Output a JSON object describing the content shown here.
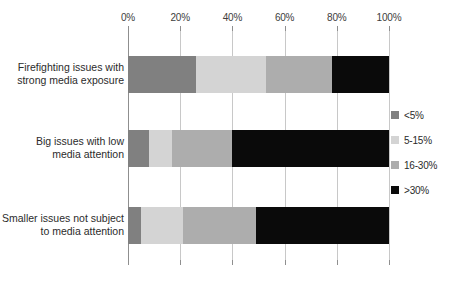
{
  "chart_data": {
    "type": "bar",
    "orientation": "horizontal",
    "stacked": true,
    "normalized_percent": true,
    "title": "",
    "subtitle": "",
    "xlabel": "",
    "ylabel": "",
    "xlim": [
      0,
      100
    ],
    "grid": true,
    "legend_position": "right",
    "xticks": [
      "0%",
      "20%",
      "40%",
      "60%",
      "80%",
      "100%"
    ],
    "xtick_values": [
      0,
      20,
      40,
      60,
      80,
      100
    ],
    "categories": [
      "Firefighting issues with strong media exposure",
      "Big issues with low media attention",
      "Smaller issues not subject to media attention"
    ],
    "category_lines": [
      [
        "Firefighting issues with",
        "strong media exposure"
      ],
      [
        "Big issues with low",
        "media attention"
      ],
      [
        "Smaller issues not subject",
        "to media attention"
      ]
    ],
    "series": [
      {
        "name": "<5%",
        "color": "#808080",
        "values": [
          26,
          8,
          5
        ]
      },
      {
        "name": "5-15%",
        "color": "#d4d4d4",
        "values": [
          27,
          9,
          16
        ]
      },
      {
        "name": "16-30%",
        "color": "#adadad",
        "values": [
          25,
          23,
          28
        ]
      },
      {
        "name": ">30%",
        "color": "#0a0a0a",
        "values": [
          22,
          60,
          51
        ]
      }
    ]
  },
  "legend": {
    "items": [
      {
        "label": "<5%",
        "color": "#808080"
      },
      {
        "label": "5-15%",
        "color": "#d4d4d4"
      },
      {
        "label": "16-30%",
        "color": "#adadad"
      },
      {
        "label": ">30%",
        "color": "#0a0a0a"
      }
    ]
  },
  "colors": {
    "grid": "#c8c8c8",
    "axis": "#8f8f8f",
    "text": "#2b2b2b",
    "background": "#ffffff"
  }
}
